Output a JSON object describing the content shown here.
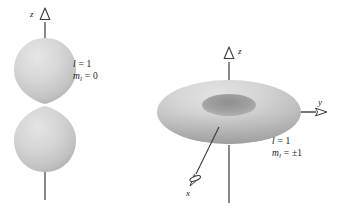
{
  "figure": {
    "background_color": "#ffffff",
    "line_color": "#3a3a3a",
    "lobe_fill_light": "#dcdcdc",
    "lobe_fill_mid": "#c9c9c9",
    "lobe_fill_dark": "#a8a8a8",
    "torus_hole_color": "#9a9a9a"
  },
  "left_diagram": {
    "name": "dumbbell-orbital",
    "shape": "two-lobe-dumbbell",
    "axis_label_z": "z",
    "quantum_numbers": {
      "l_symbol": "l",
      "l_equals": "=",
      "l_value": "1",
      "m_symbol": "m",
      "m_subscript": "l",
      "m_equals": "=",
      "m_value": "0"
    }
  },
  "right_diagram": {
    "name": "torus-orbital",
    "shape": "torus",
    "axis_label_z": "z",
    "axis_label_y": "y",
    "axis_label_x": "x",
    "quantum_numbers": {
      "l_symbol": "l",
      "l_equals": "=",
      "l_value": "1",
      "m_symbol": "m",
      "m_subscript": "l",
      "m_equals": "=",
      "m_value": "±1"
    }
  }
}
